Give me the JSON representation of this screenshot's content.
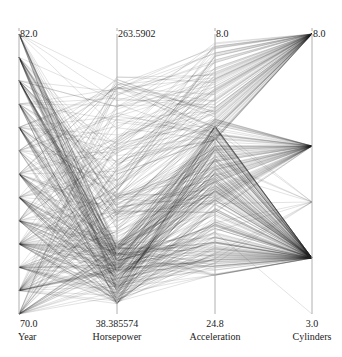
{
  "chart_data": {
    "type": "parallel_coordinates",
    "title": "",
    "axes": [
      {
        "name": "Year",
        "min": 70.0,
        "max": 82.0,
        "min_label": "70.0",
        "max_label": "82.0"
      },
      {
        "name": "Horsepower",
        "min": 38.385574,
        "max": 263.5902,
        "min_label": "38.385574",
        "max_label": "263.5902"
      },
      {
        "name": "Acceleration",
        "min": 24.8,
        "max": 8.0,
        "min_label": "24.8",
        "max_label": "8.0",
        "inverted": true
      },
      {
        "name": "Cylinders",
        "min": 3.0,
        "max": 8.0,
        "min_label": "3.0",
        "max_label": "8.0"
      }
    ],
    "line_color": "#222222",
    "line_opacity": 0.18,
    "grid": false,
    "legend": "none"
  },
  "labels": {
    "year_max": "82.0",
    "year_min": "70.0",
    "year_name": "Year",
    "hp_max": "263.5902",
    "hp_min": "38.385574",
    "hp_name": "Horsepower",
    "acc_max": "8.0",
    "acc_min": "24.8",
    "acc_name": "Acceleration",
    "cyl_max": "8.0",
    "cyl_min": "3.0",
    "cyl_name": "Cylinders"
  }
}
